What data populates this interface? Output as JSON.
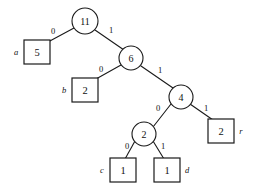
{
  "figure": {
    "background_color": "#ffffff",
    "stroke_color": "#1a1a1a",
    "width": 254,
    "height": 193
  },
  "chart_data": {
    "type": "diagram",
    "diagram_kind": "binary-tree",
    "nodes": [
      {
        "id": "n11",
        "label": "11",
        "shape": "circle",
        "kind": "internal",
        "cx": 85,
        "cy": 21,
        "r": 13
      },
      {
        "id": "n6",
        "label": "6",
        "shape": "circle",
        "kind": "internal",
        "cx": 131,
        "cy": 58,
        "r": 12
      },
      {
        "id": "n4",
        "label": "4",
        "shape": "circle",
        "kind": "internal",
        "cx": 181,
        "cy": 97,
        "r": 12
      },
      {
        "id": "n2",
        "label": "2",
        "shape": "circle",
        "kind": "internal",
        "cx": 144,
        "cy": 134,
        "r": 12
      },
      {
        "id": "a",
        "label": "5",
        "shape": "box",
        "kind": "leaf",
        "symbol": "a",
        "x": 24,
        "y": 40,
        "w": 26,
        "h": 24,
        "symbol_x": 16,
        "symbol_y": 52
      },
      {
        "id": "b",
        "label": "2",
        "shape": "box",
        "kind": "leaf",
        "symbol": "b",
        "x": 72,
        "y": 78,
        "w": 26,
        "h": 24,
        "symbol_x": 64,
        "symbol_y": 90
      },
      {
        "id": "r",
        "label": "2",
        "shape": "box",
        "kind": "leaf",
        "symbol": "r",
        "x": 208,
        "y": 119,
        "w": 26,
        "h": 24,
        "symbol_x": 241,
        "symbol_y": 131
      },
      {
        "id": "c",
        "label": "1",
        "shape": "box",
        "kind": "leaf",
        "symbol": "c",
        "x": 110,
        "y": 158,
        "w": 26,
        "h": 24,
        "symbol_x": 102,
        "symbol_y": 170
      },
      {
        "id": "d",
        "label": "1",
        "shape": "box",
        "kind": "leaf",
        "symbol": "d",
        "x": 154,
        "y": 158,
        "w": 26,
        "h": 24,
        "symbol_x": 187,
        "symbol_y": 170
      }
    ],
    "edges": [
      {
        "id": "e-n11-a",
        "from": "n11",
        "to": "a",
        "bit": "0",
        "x1": 74,
        "y1": 28,
        "x2": 48,
        "y2": 42,
        "label_x": 53,
        "label_y": 31
      },
      {
        "id": "e-n11-n6",
        "from": "n11",
        "to": "n6",
        "bit": "1",
        "x1": 95,
        "y1": 30,
        "x2": 124,
        "y2": 50,
        "label_x": 111,
        "label_y": 30
      },
      {
        "id": "e-n6-b",
        "from": "n6",
        "to": "b",
        "bit": "0",
        "x1": 121,
        "y1": 65,
        "x2": 96,
        "y2": 79,
        "label_x": 101,
        "label_y": 69
      },
      {
        "id": "e-n6-n4",
        "from": "n6",
        "to": "n4",
        "bit": "1",
        "x1": 141,
        "y1": 66,
        "x2": 173,
        "y2": 88,
        "label_x": 160,
        "label_y": 70
      },
      {
        "id": "e-n4-n2",
        "from": "n4",
        "to": "n2",
        "bit": "0",
        "x1": 171,
        "y1": 104,
        "x2": 153,
        "y2": 127,
        "label_x": 158,
        "label_y": 108
      },
      {
        "id": "e-n4-r",
        "from": "n4",
        "to": "r",
        "bit": "1",
        "x1": 190,
        "y1": 104,
        "x2": 213,
        "y2": 120,
        "label_x": 206,
        "label_y": 108
      },
      {
        "id": "e-n2-c",
        "from": "n2",
        "to": "c",
        "bit": "0",
        "x1": 135,
        "y1": 141,
        "x2": 125,
        "y2": 159,
        "label_x": 127,
        "label_y": 146
      },
      {
        "id": "e-n2-d",
        "from": "n2",
        "to": "d",
        "bit": "1",
        "x1": 153,
        "y1": 141,
        "x2": 164,
        "y2": 159,
        "label_x": 163,
        "label_y": 146
      }
    ],
    "codes": [
      {
        "symbol": "a",
        "weight": 5,
        "code": "0"
      },
      {
        "symbol": "b",
        "weight": 2,
        "code": "10"
      },
      {
        "symbol": "c",
        "weight": 1,
        "code": "1100"
      },
      {
        "symbol": "d",
        "weight": 1,
        "code": "1101"
      },
      {
        "symbol": "r",
        "weight": 2,
        "code": "111"
      }
    ]
  }
}
